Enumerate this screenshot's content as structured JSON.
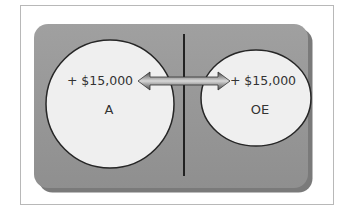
{
  "diagram": {
    "left": {
      "label": "A",
      "change": "+ $15,000"
    },
    "right": {
      "label": "OE",
      "change": "+ $15,000"
    },
    "arrow_meaning": "double-headed arrow linking A and OE",
    "colors": {
      "panel": "#9a9a9a",
      "circle": "#eeeeee",
      "circle_border": "#2a2a2a",
      "arrow": "#6a6a6a",
      "frame_border": "#b8b8b8"
    }
  }
}
